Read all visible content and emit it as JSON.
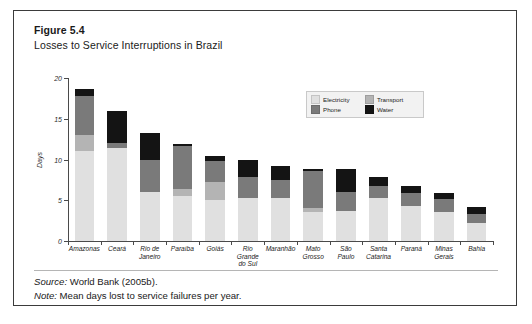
{
  "figure": {
    "number": "Figure 5.4",
    "title": "Losses to Service Interruptions in Brazil",
    "source_label": "Source:",
    "source_text": " World Bank (2005b).",
    "note_label": "Note:",
    "note_text": " Mean days lost to service failures per year."
  },
  "legend": {
    "items": [
      {
        "label": "Electricity",
        "color": "#e0e0e0",
        "swatch_name": "legend-swatch-electricity"
      },
      {
        "label": "Transport",
        "color": "#b4b4b4",
        "swatch_name": "legend-swatch-transport"
      },
      {
        "label": "Phone",
        "color": "#7a7a7a",
        "swatch_name": "legend-swatch-phone"
      },
      {
        "label": "Water",
        "color": "#141414",
        "swatch_name": "legend-swatch-water"
      }
    ]
  },
  "chart_data": {
    "type": "bar",
    "subtype": "stacked",
    "title": "Losses to Service Interruptions in Brazil",
    "subtitle": "",
    "xlabel": "",
    "ylabel": "Days",
    "ylim": [
      0,
      20
    ],
    "yticks": [
      0,
      5,
      10,
      15,
      20
    ],
    "ytick_labels": [
      "0",
      "5",
      "10",
      "15",
      "20"
    ],
    "grid": false,
    "legend_position": "top-right",
    "categories": [
      "Amazonas",
      "Ceará",
      "Rio de Janeiro",
      "Paraíba",
      "Goiás",
      "Rio Grande do Sul",
      "Maranhão",
      "Mato Grosso",
      "São Paulo",
      "Santa Catarina",
      "Paraná",
      "Minas Gerais",
      "Bahia"
    ],
    "category_lines": [
      [
        "Amazonas"
      ],
      [
        "Ceará"
      ],
      [
        "Rio de",
        "Janeiro"
      ],
      [
        "Paraíba"
      ],
      [
        "Goiás"
      ],
      [
        "Rio",
        "Grande",
        "do Sul"
      ],
      [
        "Maranhão"
      ],
      [
        "Mato",
        "Grosso"
      ],
      [
        "São",
        "Paulo"
      ],
      [
        "Santa",
        "Catarina"
      ],
      [
        "Paraná"
      ],
      [
        "Minas",
        "Gerais"
      ],
      [
        "Bahia"
      ]
    ],
    "series": [
      {
        "name": "Electricity",
        "color": "#e0e0e0",
        "values": [
          11.0,
          11.4,
          6.0,
          5.5,
          5.0,
          5.3,
          5.3,
          3.5,
          3.7,
          5.3,
          4.3,
          3.5,
          2.2
        ]
      },
      {
        "name": "Transport",
        "color": "#b4b4b4",
        "values": [
          2.0,
          0.0,
          0.0,
          0.9,
          2.2,
          0.0,
          0.0,
          0.6,
          0.0,
          0.0,
          0.0,
          0.0,
          0.0
        ]
      },
      {
        "name": "Phone",
        "color": "#7a7a7a",
        "values": [
          4.8,
          0.6,
          4.0,
          5.2,
          2.6,
          2.5,
          2.2,
          4.5,
          2.3,
          1.5,
          1.6,
          1.6,
          1.1
        ]
      },
      {
        "name": "Water",
        "color": "#141414",
        "values": [
          0.9,
          4.0,
          3.3,
          0.3,
          0.6,
          2.1,
          1.7,
          0.3,
          2.8,
          1.0,
          0.9,
          0.8,
          0.9
        ]
      }
    ],
    "totals": [
      18.7,
      16.0,
      13.3,
      11.9,
      10.4,
      9.9,
      9.2,
      8.9,
      8.8,
      7.8,
      6.8,
      5.9,
      4.2
    ]
  }
}
